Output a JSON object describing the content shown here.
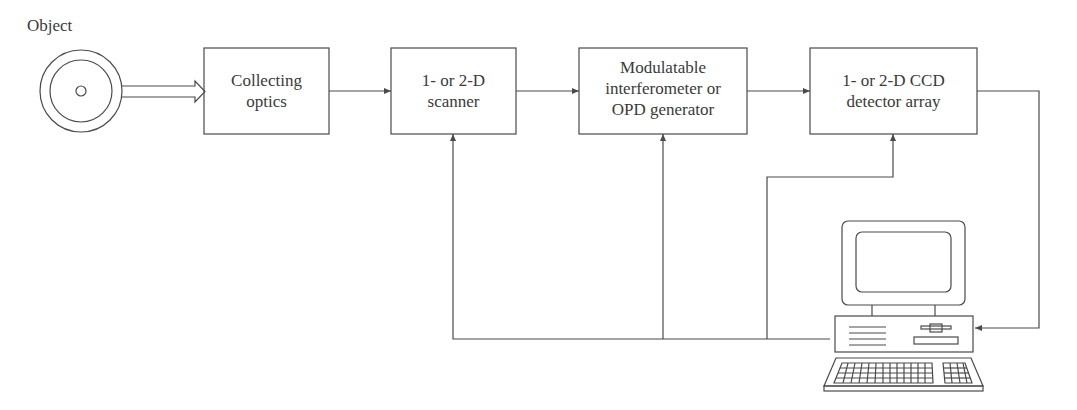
{
  "object": {
    "label": "Object"
  },
  "blocks": [
    {
      "id": "collecting-optics",
      "lines": [
        "Collecting",
        "optics"
      ]
    },
    {
      "id": "scanner",
      "lines": [
        "1- or 2-D",
        "scanner"
      ]
    },
    {
      "id": "interferometer",
      "lines": [
        "Modulatable",
        "interferometer or",
        "OPD generator"
      ]
    },
    {
      "id": "ccd",
      "lines": [
        "1- or 2-D CCD",
        "detector array"
      ]
    }
  ],
  "computer": {
    "icon": "computer-icon"
  },
  "colors": {
    "stroke": "#4a4a4a",
    "text": "#3a3a3a",
    "background": "#ffffff"
  }
}
